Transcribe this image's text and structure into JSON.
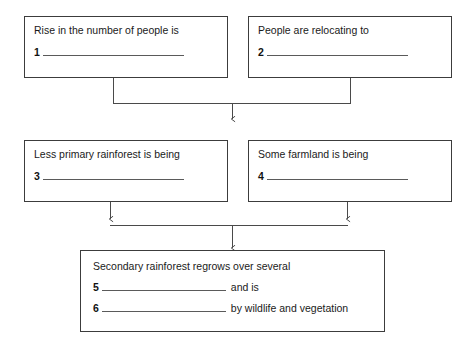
{
  "diagram": {
    "type": "flow-chart",
    "background_color": "#ffffff",
    "border_color": "#3c3c3c",
    "text_color": "#1a1a1a",
    "blank_line_color": "#5a5a5a"
  },
  "nodes": {
    "a": {
      "id": "node-a",
      "row": 1,
      "column": "left",
      "text": "Rise in the number of people is",
      "question_number": "1",
      "blank": true,
      "tail_text": ""
    },
    "b": {
      "id": "node-b",
      "row": 1,
      "column": "right",
      "text": "People are relocating to",
      "question_number": "2",
      "blank": true,
      "tail_text": ""
    },
    "c": {
      "id": "node-c",
      "row": 2,
      "column": "left",
      "text": "Less primary rainforest is being",
      "question_number": "3",
      "blank": true,
      "tail_text": ""
    },
    "d": {
      "id": "node-d",
      "row": 2,
      "column": "right",
      "text": "Some farmland is being",
      "question_number": "4",
      "blank": true,
      "tail_text": ""
    },
    "e": {
      "id": "node-e",
      "row": 3,
      "column": "center",
      "text": "Secondary rainforest regrows over several",
      "line2_number": "5",
      "line2_tail": "and is",
      "line3_number": "6",
      "line3_tail": "by wildlife and vegetation"
    }
  },
  "connectors": [
    {
      "name": "row1-to-row2",
      "from": [
        "a",
        "b"
      ],
      "to": "merge-point",
      "style": "merge-down-arrow",
      "arrowhead": true
    },
    {
      "name": "row2-to-row3",
      "from": [
        "c",
        "d"
      ],
      "to": "e",
      "style": "arrows-down-then-merge",
      "arrowhead": true
    }
  ]
}
